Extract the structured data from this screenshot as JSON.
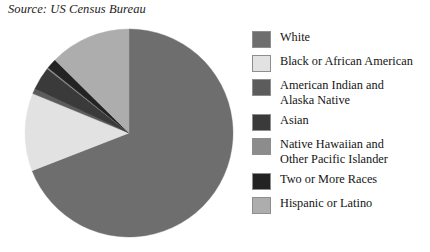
{
  "source_note": "Source: US Census Bureau",
  "legend": {
    "items": [
      {
        "label": "White",
        "color": "#6e6e6e"
      },
      {
        "label": "Black or African American",
        "color": "#e2e2e2"
      },
      {
        "label": "American Indian and\nAlaska Native",
        "color": "#5c5c5c"
      },
      {
        "label": "Asian",
        "color": "#3a3a3a"
      },
      {
        "label": "Native Hawaiian and\nOther Pacific Islander",
        "color": "#8c8c8c"
      },
      {
        "label": "Two or More Races",
        "color": "#232323"
      },
      {
        "label": "Hispanic or Latino",
        "color": "#adadad"
      }
    ]
  },
  "chart_data": {
    "type": "pie",
    "title": "",
    "subtitle": "",
    "source": "Source: US Census Bureau",
    "legend_position": "right",
    "start_angle_deg": 0,
    "direction": "clockwise",
    "center": {
      "x": 129,
      "y": 133
    },
    "radius": 104,
    "labels": [
      "White",
      "Black or African American",
      "American Indian and Alaska Native",
      "Asian",
      "Native Hawaiian and Other Pacific Islander",
      "Two or More Races",
      "Hispanic or Latino"
    ],
    "values": [
      69.1,
      12.1,
      0.8,
      3.6,
      0.2,
      1.6,
      12.6
    ],
    "colors": [
      "#6e6e6e",
      "#e2e2e2",
      "#5c5c5c",
      "#3a3a3a",
      "#8c8c8c",
      "#232323",
      "#adadad"
    ],
    "units": "percent of total population",
    "grid": false
  }
}
